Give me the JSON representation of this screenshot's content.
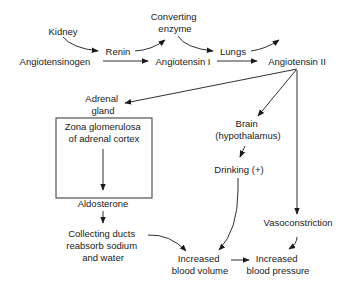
{
  "diagram": {
    "nodes": {
      "kidney": {
        "lines": [
          "Kidney"
        ]
      },
      "renin": {
        "lines": [
          "Renin"
        ]
      },
      "converting_enzyme": {
        "lines": [
          "Converting",
          "enzyme"
        ]
      },
      "lungs": {
        "lines": [
          "Lungs"
        ]
      },
      "angiotensinogen": {
        "lines": [
          "Angiotensinogen"
        ]
      },
      "angiotensin_1": {
        "lines": [
          "Angiotensin I"
        ]
      },
      "angiotensin_2": {
        "lines": [
          "Angiotensin II"
        ]
      },
      "adrenal_gland": {
        "lines": [
          "Adrenal",
          "gland"
        ]
      },
      "zona_glomerulosa": {
        "lines": [
          "Zona glomerulosa",
          "of adrenal cortex"
        ]
      },
      "brain": {
        "lines": [
          "Brain",
          "(hypothalamus)"
        ]
      },
      "drinking": {
        "lines": [
          "Drinking (+)"
        ]
      },
      "aldosterone": {
        "lines": [
          "Aldosterone"
        ]
      },
      "vasoconstriction": {
        "lines": [
          "Vasoconstriction"
        ]
      },
      "collecting_ducts": {
        "lines": [
          "Collecting ducts",
          "reabsorb sodium",
          "and water"
        ]
      },
      "blood_volume": {
        "lines": [
          "Increased",
          "blood volume"
        ]
      },
      "blood_pressure": {
        "lines": [
          "Increased",
          "blood pressure"
        ]
      }
    },
    "edges": [
      {
        "from": "kidney",
        "to": "renin"
      },
      {
        "from": "renin",
        "to": "angiotensin_1",
        "label": "catalyzes"
      },
      {
        "from": "angiotensinogen",
        "to": "angiotensin_1"
      },
      {
        "from": "converting_enzyme",
        "to": "lungs"
      },
      {
        "from": "lungs",
        "to": "angiotensin_2"
      },
      {
        "from": "angiotensin_1",
        "to": "angiotensin_2"
      },
      {
        "from": "angiotensin_2",
        "to": "adrenal_gland"
      },
      {
        "from": "angiotensin_2",
        "to": "brain"
      },
      {
        "from": "angiotensin_2",
        "to": "vasoconstriction"
      },
      {
        "from": "zona_glomerulosa",
        "to": "aldosterone"
      },
      {
        "from": "aldosterone",
        "to": "collecting_ducts"
      },
      {
        "from": "brain",
        "to": "drinking"
      },
      {
        "from": "drinking",
        "to": "blood_volume"
      },
      {
        "from": "collecting_ducts",
        "to": "blood_volume"
      },
      {
        "from": "blood_volume",
        "to": "blood_pressure"
      },
      {
        "from": "vasoconstriction",
        "to": "blood_pressure"
      }
    ]
  }
}
